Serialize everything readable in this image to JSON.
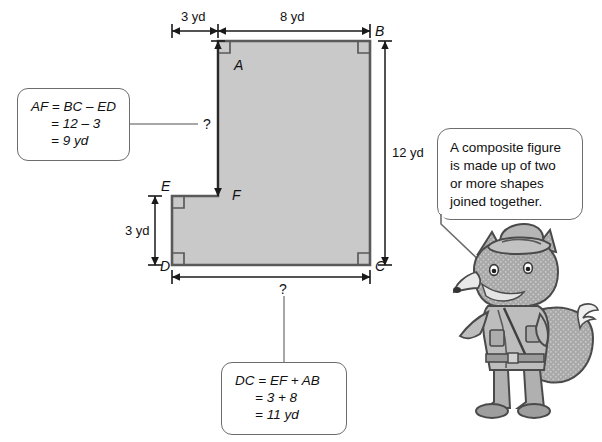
{
  "figure": {
    "name": "composite-figure",
    "shape": "L-shaped composite figure",
    "fill_color": "#c9c9c9",
    "stroke_color": "#5a5a5a",
    "vertices": [
      {
        "id": "A",
        "label": "A"
      },
      {
        "id": "B",
        "label": "B"
      },
      {
        "id": "C",
        "label": "C"
      },
      {
        "id": "D",
        "label": "D"
      },
      {
        "id": "E",
        "label": "E"
      },
      {
        "id": "F",
        "label": "F"
      }
    ]
  },
  "dimensions": {
    "top_left": "3 yd",
    "top_right": "8 yd",
    "right_side": "12 yd",
    "left_side": "3 yd",
    "unknown_vertical": "?",
    "unknown_bottom": "?"
  },
  "callouts": {
    "af": {
      "line1": "AF = BC – ED",
      "line2": "= 12 – 3",
      "line3": "= 9 yd"
    },
    "dc": {
      "line1": "DC = EF + AB",
      "line2": "= 3 + 8",
      "line3": "= 11 yd"
    }
  },
  "speech_bubble": {
    "line1": "A composite figure",
    "line2": "is made up of two",
    "line3": "or more shapes",
    "line4": "joined together."
  },
  "mascot": {
    "name": "fox-character",
    "description": "cartoon fox wearing hat and explorer outfit"
  }
}
